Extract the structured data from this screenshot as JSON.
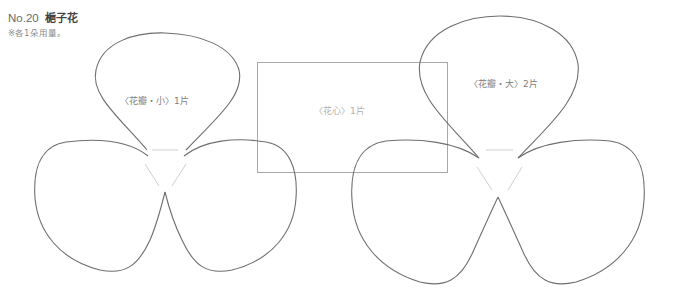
{
  "header": {
    "number": "No.20",
    "name": "梔子花",
    "note": "※各1朵用量。"
  },
  "pieces": [
    {
      "id": "petal-small",
      "label": "〈花瓣・小〉1片"
    },
    {
      "id": "center",
      "label": "〈花心〉1片"
    },
    {
      "id": "petal-large",
      "label": "〈花瓣・大〉2片"
    }
  ],
  "colors": {
    "outline": "#6e6e6e",
    "guide": "#cfcfcf",
    "rect": "#a8a8a8",
    "text": "#808080"
  }
}
